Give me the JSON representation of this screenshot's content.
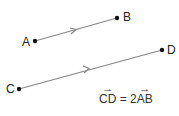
{
  "diagram": {
    "points": [
      {
        "id": "A",
        "label": "A",
        "x": 35,
        "y": 41
      },
      {
        "id": "B",
        "label": "B",
        "x": 117,
        "y": 18
      },
      {
        "id": "C",
        "label": "C",
        "x": 19,
        "y": 89
      },
      {
        "id": "D",
        "label": "D",
        "x": 162,
        "y": 50
      }
    ],
    "vectors": [
      {
        "from": "A",
        "to": "B"
      },
      {
        "from": "C",
        "to": "D"
      }
    ],
    "formula": {
      "lhs": "CD",
      "equals": "=",
      "coef": "2",
      "rhs": "AB"
    },
    "colors": {
      "line": "#888888",
      "point": "#111111",
      "text": "#222222"
    }
  }
}
